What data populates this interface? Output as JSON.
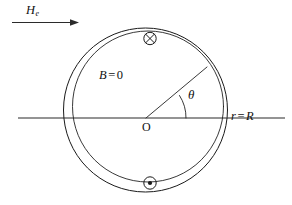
{
  "figure": {
    "background_color": "#ffffff",
    "stroke_color": "#1a1a1a",
    "width": 292,
    "height": 205
  },
  "labels": {
    "applied_field": {
      "symbol": "H",
      "subscript": "e",
      "full": "He"
    },
    "interior_field": {
      "symbol": "B",
      "equals": "=",
      "value": "0",
      "full": "B = 0"
    },
    "origin": "O",
    "angle": "θ",
    "boundary": {
      "variable": "r",
      "equals": "=",
      "value": "R",
      "full": "r = R"
    }
  },
  "symbols": {
    "field_into_page": {
      "name": "circle-cross",
      "glyph": "⊗",
      "position": "top"
    },
    "field_out_of_page": {
      "name": "circle-dot",
      "glyph": "⊙",
      "position": "bottom"
    }
  },
  "geometry": {
    "outer_circle": {
      "cx": 145.5,
      "cy": 110.0,
      "r": 82.0
    },
    "inner_circle": {
      "cx": 148.0,
      "cy": 106.5,
      "r": 75.5
    },
    "axis": {
      "x1": 18,
      "x2": 285,
      "y": 118
    },
    "arrow": {
      "x1": 12,
      "x2": 78,
      "y": 22
    },
    "radius_line": {
      "x1": 146,
      "y1": 118,
      "x2": 207,
      "y2": 67
    },
    "angle_degrees": 33
  }
}
